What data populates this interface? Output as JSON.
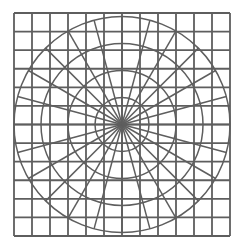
{
  "diagram": {
    "background": "#ffffff",
    "line_color": "#5e5e5e",
    "grid": {
      "left": 14,
      "top": 13,
      "right": 230,
      "bottom": 236,
      "columns": 12,
      "rows": 12,
      "stroke_width": 1.8
    },
    "polar": {
      "center_x": 122,
      "center_y": 124.5,
      "radii": [
        27,
        54,
        81,
        108
      ],
      "radial_count": 24,
      "radial_length": 108,
      "stroke_width": 1.5
    }
  }
}
